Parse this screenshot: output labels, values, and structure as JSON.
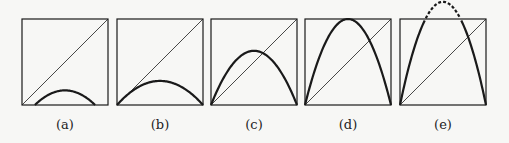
{
  "figure": {
    "panels": [
      {
        "label": "(a)",
        "x": 22,
        "peak": 0.17,
        "x_start": 0.15,
        "x_end": 0.85,
        "dashed_overflow": false
      },
      {
        "label": "(b)",
        "x": 117,
        "peak": 0.28,
        "x_start": 0.0,
        "x_end": 1.0,
        "dashed_overflow": false
      },
      {
        "label": "(c)",
        "x": 211,
        "peak": 0.63,
        "x_start": 0.0,
        "x_end": 1.0,
        "dashed_overflow": false
      },
      {
        "label": "(d)",
        "x": 305,
        "peak": 1.0,
        "x_start": 0.0,
        "x_end": 1.0,
        "dashed_overflow": false
      },
      {
        "label": "(e)",
        "x": 400,
        "peak": 1.2,
        "x_start": 0.0,
        "x_end": 1.0,
        "dashed_overflow": true
      }
    ],
    "box_top": 19,
    "box_size": 86,
    "colors": {
      "stroke": "#1a1a1a",
      "background": "#f7f7f5"
    }
  }
}
